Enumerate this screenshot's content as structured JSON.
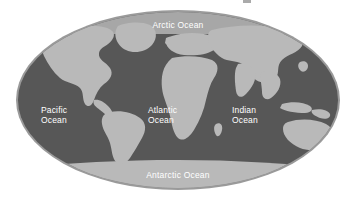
{
  "figure": {
    "kind": "world-map",
    "projection": "oval-mollweide",
    "background_color": "#ffffff"
  },
  "colors": {
    "ocean": "#575757",
    "land": "#b9b9b9",
    "polar_band": "#a7a7a7",
    "ring": "#9a9a9a",
    "label_text": "#ffffff",
    "page_background": "#ffffff"
  },
  "map": {
    "ellipse": {
      "center_x": 178,
      "center_y": 100,
      "radius_x": 162,
      "radius_y": 90
    },
    "ocean_labels": [
      {
        "id": "arctic",
        "name": "arctic-ocean-label",
        "lines": [
          "Arctic Ocean"
        ],
        "x": 178,
        "y": 25,
        "anchor": "middle"
      },
      {
        "id": "pacific",
        "name": "pacific-ocean-label",
        "lines": [
          "Pacific",
          "Ocean"
        ],
        "x": 41,
        "y": 113,
        "anchor": "start"
      },
      {
        "id": "atlantic",
        "name": "atlantic-ocean-label",
        "lines": [
          "Atlantic",
          "Ocean"
        ],
        "x": 148,
        "y": 113,
        "anchor": "start"
      },
      {
        "id": "indian",
        "name": "indian-ocean-label",
        "lines": [
          "Indian",
          "Ocean"
        ],
        "x": 232,
        "y": 113,
        "anchor": "start"
      },
      {
        "id": "antarctic",
        "name": "antarctic-ocean-label",
        "lines": [
          "Antarctic Ocean"
        ],
        "x": 178,
        "y": 176,
        "anchor": "middle"
      }
    ],
    "landmasses": [
      "north-america",
      "south-america",
      "greenland",
      "europe",
      "africa",
      "asia",
      "australia",
      "indonesia",
      "antarctica"
    ]
  },
  "labels": {
    "arctic_ocean": "Arctic Ocean",
    "pacific_ocean_line1": "Pacific",
    "pacific_ocean_line2": "Ocean",
    "atlantic_ocean_line1": "Atlantic",
    "atlantic_ocean_line2": "Ocean",
    "indian_ocean_line1": "Indian",
    "indian_ocean_line2": "Ocean",
    "antarctic_ocean": "Antarctic Ocean"
  }
}
